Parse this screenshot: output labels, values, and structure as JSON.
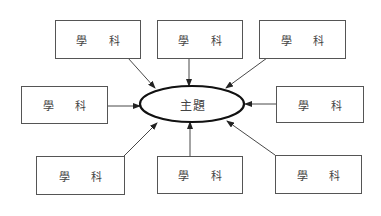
{
  "diagram": {
    "center": {
      "label": "主題"
    },
    "nodes": [
      {
        "id": "top-left",
        "label": "學 科"
      },
      {
        "id": "top-center",
        "label": "學 科"
      },
      {
        "id": "top-right",
        "label": "學 科"
      },
      {
        "id": "middle-left",
        "label": "學 科"
      },
      {
        "id": "middle-right",
        "label": "學 科"
      },
      {
        "id": "bottom-left",
        "label": "學 科"
      },
      {
        "id": "bottom-center",
        "label": "學 科"
      },
      {
        "id": "bottom-right",
        "label": "學 科"
      }
    ],
    "edges": [
      {
        "from": "top-left",
        "to": "center"
      },
      {
        "from": "top-center",
        "to": "center"
      },
      {
        "from": "top-right",
        "to": "center"
      },
      {
        "from": "middle-left",
        "to": "center"
      },
      {
        "from": "middle-right",
        "to": "center"
      },
      {
        "from": "bottom-left",
        "to": "center"
      },
      {
        "from": "bottom-center",
        "to": "center"
      },
      {
        "from": "bottom-right",
        "to": "center"
      }
    ],
    "colors": {
      "line": "#333333",
      "text": "#444444"
    }
  }
}
